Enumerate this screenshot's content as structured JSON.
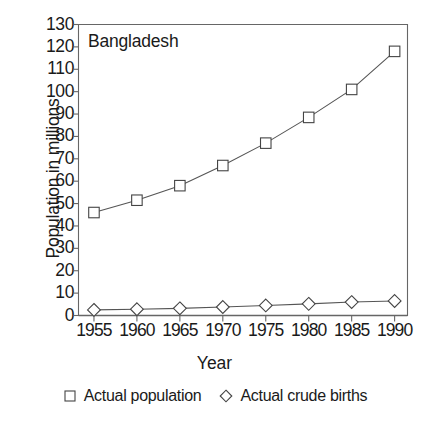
{
  "chart_data": {
    "type": "line",
    "title": "Bangladesh",
    "xlabel": "Year",
    "ylabel": "Population in millions",
    "x": [
      1955,
      1960,
      1965,
      1970,
      1975,
      1980,
      1985,
      1990
    ],
    "xticklabels": [
      "1955",
      "1960",
      "1965",
      "1970",
      "1975",
      "1980",
      "1985",
      "1990"
    ],
    "xlim": [
      1953.2,
      1991.5
    ],
    "ylim": [
      0,
      130
    ],
    "yticks": [
      0,
      10,
      20,
      30,
      40,
      50,
      60,
      70,
      80,
      90,
      100,
      110,
      120,
      130
    ],
    "yticklabels": [
      "0",
      "10",
      "20",
      "30",
      "40",
      "50",
      "60",
      "70",
      "80",
      "90",
      "100",
      "110",
      "120",
      "130"
    ],
    "grid": false,
    "legend_position": "below-axes",
    "series": [
      {
        "name": "Actual population",
        "marker": "square",
        "values": [
          46,
          51.5,
          58,
          67,
          77,
          88.5,
          101,
          118
        ]
      },
      {
        "name": "Actual crude births",
        "marker": "diamond",
        "values": [
          2.5,
          2.8,
          3.2,
          3.8,
          4.5,
          5.2,
          6.0,
          6.5
        ]
      }
    ],
    "colors": {
      "line": "#555555",
      "marker_stroke": "#444444",
      "marker_fill": "#ffffff",
      "axis": "#666666",
      "text": "#1a1a1a",
      "background": "#ffffff"
    }
  },
  "legend": {
    "entries": [
      {
        "label": "Actual population",
        "marker": "square-marker-icon"
      },
      {
        "label": "Actual crude births",
        "marker": "diamond-marker-icon"
      }
    ]
  }
}
